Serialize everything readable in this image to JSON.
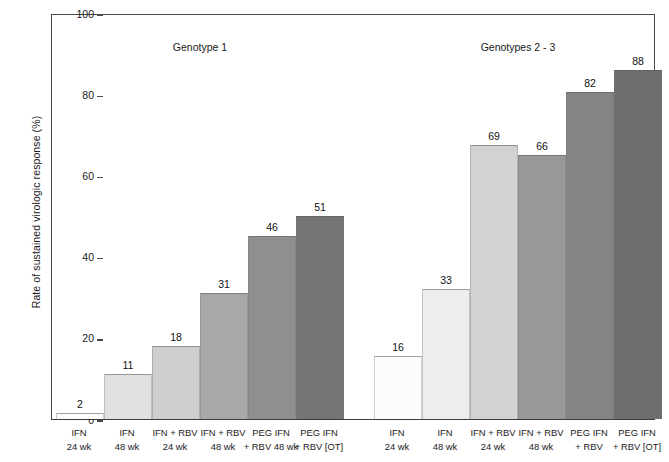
{
  "chart_data": {
    "type": "bar",
    "title": "",
    "xlabel": "",
    "ylabel": "Rate of sustained virologic response (%)",
    "ylim": [
      0,
      100
    ],
    "yticks": [
      0,
      20,
      40,
      60,
      80,
      100
    ],
    "ytick_labels": [
      "0",
      "20",
      "40",
      "60",
      "80",
      "100"
    ],
    "grid": false,
    "legend": "none",
    "group_titles": [
      "Genotype 1",
      "Genotypes 2 - 3"
    ],
    "groups": [
      {
        "name": "Genotype 1",
        "categories": [
          {
            "line1": "IFN",
            "line2": "24 wk"
          },
          {
            "line1": "IFN",
            "line2": "48 wk"
          },
          {
            "line1": "IFN + RBV",
            "line2": "24 wk"
          },
          {
            "line1": "IFN + RBV",
            "line2": "48 wk"
          },
          {
            "line1": "PEG IFN",
            "line2": "+ RBV 48 wk"
          },
          {
            "line1": "PEG IFN",
            "line2": "+ RBV [OT]"
          }
        ],
        "values": [
          2,
          11,
          18,
          31,
          46,
          51
        ],
        "bar_heights_pct": [
          1.5,
          11,
          18,
          31,
          45,
          50
        ],
        "colors": [
          "#fbfbfb",
          "#e0e0e0",
          "#cfcfcf",
          "#a8a8a8",
          "#8f8f8f",
          "#747474"
        ]
      },
      {
        "name": "Genotypes 2 - 3",
        "categories": [
          {
            "line1": "IFN",
            "line2": "24 wk"
          },
          {
            "line1": "IFN",
            "line2": "48 wk"
          },
          {
            "line1": "IFN + RBV",
            "line2": "24 wk"
          },
          {
            "line1": "IFN + RBV",
            "line2": "48 wk"
          },
          {
            "line1": "PEG IFN",
            "line2": "+ RBV"
          },
          {
            "line1": "PEG IFN",
            "line2": "+ RBV [OT]"
          }
        ],
        "values": [
          16,
          33,
          69,
          66,
          82,
          88
        ],
        "bar_heights_pct": [
          15.5,
          32,
          67.5,
          65,
          80.5,
          86
        ],
        "colors": [
          "#fcfcfc",
          "#ededed",
          "#d2d2d2",
          "#989898",
          "#848484",
          "#6e6e6e"
        ]
      }
    ]
  }
}
